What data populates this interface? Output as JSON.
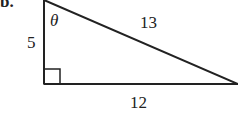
{
  "problem": {
    "part_label": "b."
  },
  "triangle": {
    "type": "right-triangle",
    "angle_label": "θ",
    "sides": {
      "vertical": "5",
      "hypotenuse": "13",
      "horizontal": "12"
    },
    "right_angle_marker": true
  }
}
